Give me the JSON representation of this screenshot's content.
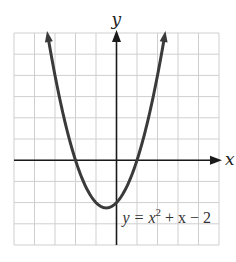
{
  "chart_data": {
    "type": "line",
    "title": "",
    "equation": "y = x^2 + x - 2",
    "equation_parts": {
      "lhs": "y = x",
      "exp": "2",
      "rhs": " + x − 2"
    },
    "xlabel": "x",
    "ylabel": "y",
    "xlim": [
      -5,
      5
    ],
    "ylim": [
      -4,
      6
    ],
    "grid": true,
    "grid_step": 1,
    "tick_labels": false,
    "series": [
      {
        "name": "y = x^2 + x - 2",
        "x": [
          -3.37,
          -3,
          -2.5,
          -2,
          -1.5,
          -1,
          -0.5,
          0,
          0.5,
          1,
          1.5,
          2,
          2.37
        ],
        "y": [
          6,
          4,
          1.75,
          0,
          -1.25,
          -2,
          -2.25,
          -2,
          -1.25,
          0,
          1.75,
          4,
          6
        ]
      }
    ],
    "key_points": {
      "vertex": [
        -0.5,
        -2.25
      ],
      "x_intercepts": [
        [
          -2,
          0
        ],
        [
          1,
          0
        ]
      ],
      "y_intercept": [
        0,
        -2
      ]
    },
    "colors": {
      "curve": "#3a3a3a",
      "grid": "#cfcfcf",
      "axis": "#1a1a1a"
    }
  }
}
